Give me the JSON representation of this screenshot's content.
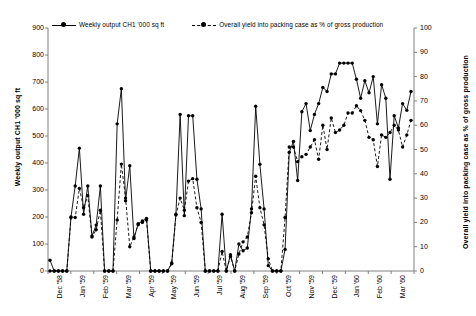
{
  "chart_data": {
    "type": "line",
    "title": "",
    "xlabel": "",
    "ylabel": "Weekly output CH1 '000 sq ft",
    "y2label": "Overall yield into packing case as % of gross production",
    "ylim": [
      0,
      900
    ],
    "y2lim": [
      0,
      100
    ],
    "grid": false,
    "legend_position": "top",
    "y_ticks": [
      "0",
      "100",
      "200",
      "300",
      "400",
      "500",
      "600",
      "700",
      "800",
      "900"
    ],
    "y2_ticks": [
      "0",
      "10",
      "20",
      "30",
      "40",
      "50",
      "60",
      "70",
      "80",
      "90",
      "100"
    ],
    "x_ticks": [
      "Dec '58",
      "Jan '59",
      "Feb '59",
      "Mar '59",
      "Apr '59",
      "May '59",
      "Jun '59",
      "Jul '59",
      "Aug '59",
      "Sep '59",
      "Oct '59",
      "Nov '59",
      "Dec '59",
      "Jan '60",
      "Feb '60",
      "Mar '60"
    ],
    "x": [
      0.15,
      0.35,
      0.55,
      0.75,
      0.95,
      1.2,
      1.45,
      1.7,
      1.95,
      2.2,
      2.45,
      2.7,
      2.95,
      3.2,
      3.45,
      3.7,
      3.95,
      4.2,
      4.45,
      4.7,
      4.95,
      5.2,
      5.45,
      5.7,
      5.95,
      6.2,
      6.45,
      6.7,
      6.95,
      7.2,
      7.45,
      7.7,
      7.95,
      8.2,
      8.45,
      8.7,
      8.95,
      9.2,
      9.45,
      9.7,
      9.95,
      10.2,
      10.45,
      10.7,
      10.95,
      11.2,
      11.45,
      11.7,
      11.95,
      12.2,
      12.45,
      12.7,
      12.95,
      13.2,
      13.45,
      13.7,
      13.95,
      14.2,
      14.45,
      14.7,
      14.95,
      15.2,
      15.45,
      15.7
    ],
    "series": [
      {
        "name": "Weekly output CH1 '000 sq ft",
        "axis": "left",
        "style": "solid",
        "marker": "circle",
        "color": "#000000",
        "values": [
          40,
          0,
          0,
          0,
          0,
          200,
          315,
          455,
          210,
          315,
          130,
          170,
          315,
          0,
          0,
          0,
          545,
          675,
          260,
          390,
          120,
          175,
          185,
          195,
          0,
          0,
          0,
          0,
          0,
          30,
          210,
          580,
          205,
          575,
          575,
          340,
          230,
          0,
          0,
          0,
          0,
          210,
          0,
          60,
          0,
          100,
          75,
          85,
          230,
          610,
          395,
          230,
          20,
          0,
          0,
          0,
          80,
          440,
          480,
          335,
          590,
          620,
          520,
          580
        ]
      },
      {
        "name": "Overall yield into packing case as % of gross production",
        "axis": "right",
        "style": "dashed",
        "marker": "circle",
        "color": "#000000",
        "values": [
          0,
          0,
          0,
          0,
          0,
          22,
          22,
          34,
          26,
          31,
          14,
          17,
          25,
          0,
          0,
          0,
          21,
          44,
          30,
          10,
          14,
          19,
          20,
          21,
          0,
          0,
          0,
          0,
          0,
          3,
          23,
          30,
          25,
          37,
          38,
          26,
          20,
          0,
          0,
          0,
          0,
          8,
          0,
          6,
          0,
          7,
          12,
          14,
          24,
          39,
          26,
          19,
          5,
          0,
          0,
          0,
          22,
          51,
          51,
          45,
          47,
          48,
          51,
          54
        ]
      }
    ],
    "series_tail": {
      "note": "continuation beyond Mar '60 marker within plot",
      "left_values": [
        620,
        680,
        665,
        730,
        730,
        770,
        770,
        770,
        770,
        710,
        640,
        705,
        660,
        720,
        545,
        690,
        640,
        340,
        575,
        530,
        620,
        595,
        665
      ],
      "right_values": [
        46,
        60,
        50,
        63,
        57,
        58,
        60,
        65,
        65,
        68,
        66,
        62,
        55,
        54,
        43,
        56,
        55,
        57,
        60,
        58,
        51,
        56,
        62
      ]
    }
  },
  "legend": {
    "entries": [
      {
        "label": "Weekly output CH1 '000 sq ft",
        "style": "solid"
      },
      {
        "label": "Overall yield into packing case as % of gross production",
        "style": "dashed"
      }
    ]
  }
}
